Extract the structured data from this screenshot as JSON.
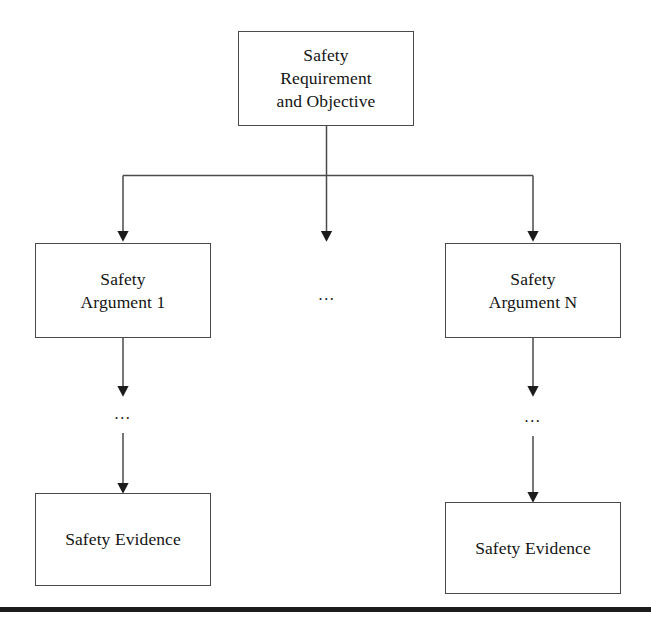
{
  "diagram": {
    "background_color": "#ffffff",
    "line_color": "#4a4a4a",
    "text_color": "#141414",
    "rule_color": "#1c1c1c",
    "nodes": [
      {
        "id": "root",
        "label": "Safety\nRequirement\nand Objective"
      },
      {
        "id": "argument-1",
        "label": "Safety\nArgument 1"
      },
      {
        "id": "argument-n",
        "label": "Safety\nArgument N"
      },
      {
        "id": "evidence-left",
        "label": "Safety Evidence"
      },
      {
        "id": "evidence-right",
        "label": "Safety Evidence"
      }
    ],
    "ellipses": [
      {
        "id": "middle-branch-ellipsis",
        "label": "..."
      },
      {
        "id": "left-chain-ellipsis",
        "label": "..."
      },
      {
        "id": "right-chain-ellipsis",
        "label": "..."
      }
    ]
  }
}
